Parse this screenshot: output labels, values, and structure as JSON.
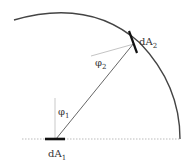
{
  "diagram": {
    "title": "",
    "labels": {
      "dA1": {
        "main": "dA",
        "sub": "1"
      },
      "dA2": {
        "main": "dA",
        "sub": "2"
      },
      "phi1": {
        "main": "φ",
        "sub": "1"
      },
      "phi2": {
        "main": "φ",
        "sub": "2"
      }
    },
    "colors": {
      "arc": "#444444",
      "ray": "#555555",
      "element_bar": "#111111",
      "normal_line": "#bbbbbb",
      "baseline": "#aaaaaa",
      "text": "#333333"
    }
  }
}
